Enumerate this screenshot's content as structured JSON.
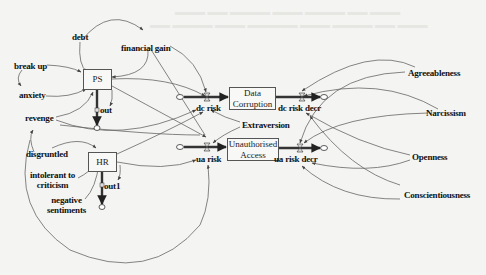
{
  "diagram": {
    "type": "system-dynamics stock-and-flow",
    "stocks": [
      {
        "id": "ps",
        "label": "PS"
      },
      {
        "id": "hr",
        "label": "HR"
      },
      {
        "id": "dc",
        "label": "Data\nCorruption",
        "line1": "Data",
        "line2": "Corruption"
      },
      {
        "id": "ua",
        "label": "Unauthorised\nAccess",
        "line1": "Unauthorised",
        "line2": "Access"
      }
    ],
    "flows": [
      {
        "id": "ps_out",
        "label": "out"
      },
      {
        "id": "hr_out",
        "label": "out1"
      },
      {
        "id": "dc_risk",
        "label": "dc risk"
      },
      {
        "id": "dc_risk_decr",
        "label": "dc risk decr"
      },
      {
        "id": "ua_risk",
        "label": "ua risk"
      },
      {
        "id": "ua_risk_decr",
        "label": "ua risk decr"
      }
    ],
    "variables": [
      {
        "id": "debt",
        "label": "debt"
      },
      {
        "id": "financial_gain",
        "label": "financial gain"
      },
      {
        "id": "break_up",
        "label": "break up"
      },
      {
        "id": "anxiety",
        "label": "anxiety"
      },
      {
        "id": "revenge",
        "label": "revenge"
      },
      {
        "id": "disgruntled",
        "label": "disgruntled"
      },
      {
        "id": "intolerant",
        "label": "intolerant to\ncriticism",
        "line1": "intolerant to",
        "line2": "criticism"
      },
      {
        "id": "negative",
        "label": "negative\nsentiments",
        "line1": "negative",
        "line2": "sentiments"
      },
      {
        "id": "extraversion",
        "label": "Extraversion"
      },
      {
        "id": "agreeableness",
        "label": "Agreeableness"
      },
      {
        "id": "narcissism",
        "label": "Narcissism"
      },
      {
        "id": "openness",
        "label": "Openness"
      },
      {
        "id": "conscientiousness",
        "label": "Conscientiousness"
      }
    ],
    "links": [
      [
        "debt",
        "ps"
      ],
      [
        "debt",
        "financial_gain"
      ],
      [
        "financial_gain",
        "ps"
      ],
      [
        "financial_gain",
        "dc_risk"
      ],
      [
        "break_up",
        "ps"
      ],
      [
        "break_up",
        "anxiety"
      ],
      [
        "anxiety",
        "ps"
      ],
      [
        "revenge",
        "ps"
      ],
      [
        "revenge",
        "dc_risk"
      ],
      [
        "disgruntled",
        "hr"
      ],
      [
        "disgruntled",
        "revenge"
      ],
      [
        "intolerant",
        "hr"
      ],
      [
        "negative",
        "hr"
      ],
      [
        "ps",
        "dc_risk"
      ],
      [
        "ps",
        "ua_risk"
      ],
      [
        "ps",
        "ps_out"
      ],
      [
        "hr",
        "ua_risk"
      ],
      [
        "hr",
        "dc_risk"
      ],
      [
        "hr",
        "hr_out"
      ],
      [
        "extraversion",
        "dc_risk"
      ],
      [
        "extraversion",
        "ua_risk"
      ],
      [
        "agreeableness",
        "dc_risk_decr"
      ],
      [
        "agreeableness",
        "ua_risk"
      ],
      [
        "narcissism",
        "dc_risk_decr"
      ],
      [
        "narcissism",
        "ua_risk"
      ],
      [
        "openness",
        "dc_risk_decr"
      ],
      [
        "openness",
        "ua_risk_decr"
      ],
      [
        "conscientiousness",
        "dc_risk_decr"
      ],
      [
        "conscientiousness",
        "ua_risk_decr"
      ],
      [
        "revenge",
        "ua_risk"
      ]
    ],
    "colors": {
      "line": "#555555",
      "flow_pipe": "#333333",
      "text": "#111111",
      "background": "#f4f4f2"
    }
  }
}
